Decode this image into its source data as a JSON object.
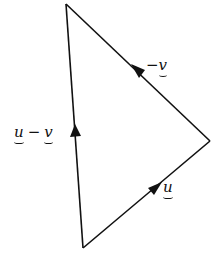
{
  "diagram": {
    "type": "vector-triangle",
    "vertices": {
      "top": [
        66,
        4
      ],
      "right": [
        210,
        141
      ],
      "bottom": [
        83,
        248
      ]
    },
    "edges": [
      {
        "id": "u",
        "from": "bottom",
        "to": "right",
        "label": "u"
      },
      {
        "id": "neg_v",
        "from": "right",
        "to": "top",
        "label_sign": "−",
        "label_var": "v"
      },
      {
        "id": "u_minus_v",
        "from": "bottom",
        "to": "top",
        "label_left": "u",
        "label_op": "−",
        "label_right": "v"
      }
    ],
    "colors": {
      "line": "#111111",
      "background": "#ffffff"
    }
  }
}
